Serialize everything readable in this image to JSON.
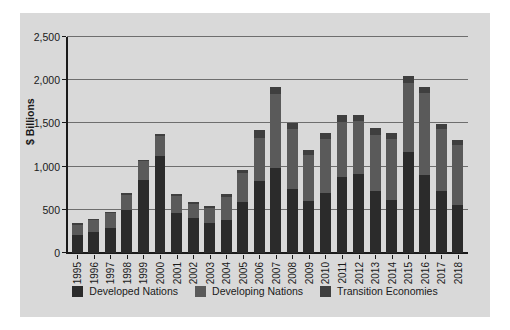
{
  "chart_data": {
    "type": "bar",
    "subtype": "stacked-vertical",
    "title": "",
    "xlabel": "",
    "ylabel": "$ Billions",
    "ylim": [
      0,
      2500
    ],
    "ytick_values": [
      0,
      500,
      1000,
      1500,
      2000,
      2500
    ],
    "ytick_labels": [
      "0",
      "500",
      "1,000",
      "1,500",
      "2,000",
      "2,500"
    ],
    "grid": true,
    "grid_axis": "y",
    "legend_position": "bottom",
    "categories": [
      "1995",
      "1996",
      "1997",
      "1998",
      "1999",
      "2000",
      "2001",
      "2002",
      "2003",
      "2004",
      "2005",
      "2006",
      "2007",
      "2008",
      "2009",
      "2010",
      "2011",
      "2012",
      "2013",
      "2014",
      "2015",
      "2016",
      "2017",
      "2018"
    ],
    "series": [
      {
        "name": "Developed Nations",
        "color": "#2b2b2b",
        "values": [
          205,
          240,
          285,
          500,
          845,
          1125,
          460,
          410,
          345,
          385,
          585,
          835,
          985,
          740,
          605,
          690,
          880,
          915,
          715,
          615,
          1170,
          900,
          715,
          555
        ]
      },
      {
        "name": "Developing Nations",
        "color": "#5a5a5a",
        "values": [
          125,
          140,
          175,
          175,
          215,
          230,
          200,
          160,
          175,
          265,
          345,
          500,
          850,
          700,
          525,
          625,
          640,
          610,
          650,
          710,
          800,
          950,
          720,
          700
        ]
      },
      {
        "name": "Transition Economies",
        "color": "#3f3f3f",
        "values": [
          12,
          15,
          20,
          20,
          20,
          20,
          25,
          20,
          25,
          30,
          35,
          85,
          90,
          70,
          65,
          70,
          75,
          70,
          85,
          65,
          75,
          75,
          60,
          55
        ]
      }
    ],
    "totals": [
      342,
      395,
      480,
      695,
      1080,
      1375,
      685,
      590,
      545,
      680,
      965,
      1420,
      1925,
      1510,
      1195,
      1385,
      1595,
      1595,
      1450,
      1390,
      2045,
      1925,
      1495,
      1310
    ]
  },
  "legend": {
    "items": [
      {
        "label": "Developed Nations",
        "color": "#2b2b2b",
        "swatch_name": "legend-swatch-developed"
      },
      {
        "label": "Developing Nations",
        "color": "#5a5a5a",
        "swatch_name": "legend-swatch-developing"
      },
      {
        "label": "Transition Economies",
        "color": "#3f3f3f",
        "swatch_name": "legend-swatch-transition"
      }
    ]
  },
  "style": {
    "panel_background": "#d9d9d9",
    "page_background": "#ffffff",
    "axis_color": "#1a1a1a",
    "grid_color": "#6e6e6e"
  }
}
